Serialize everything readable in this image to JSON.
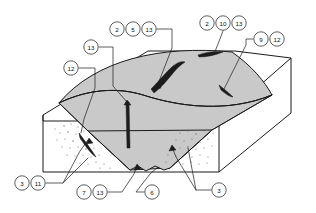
{
  "figure": {
    "type": "block-diagram",
    "background_color": "#ffffff",
    "line_color": "#1a1a1a",
    "basin_fill_color": "#c9c9c9",
    "block_top_fill_color": "#ffffff",
    "sliver_fill_color": "#1c1c1c",
    "stipple_color": "#6d6d6d"
  },
  "callouts": [
    {
      "id": "c-13-upper-left",
      "label": "13",
      "cx": 91,
      "cy": 47
    },
    {
      "id": "c-12-left",
      "label": "12",
      "cx": 71,
      "cy": 68
    },
    {
      "id": "c-2-top",
      "label": "2",
      "cx": 117,
      "cy": 29
    },
    {
      "id": "c-5-top",
      "label": "5",
      "cx": 133,
      "cy": 29
    },
    {
      "id": "c-13-top",
      "label": "13",
      "cx": 149,
      "cy": 29
    },
    {
      "id": "c-2-topright",
      "label": "2",
      "cx": 207,
      "cy": 23
    },
    {
      "id": "c-10-topright",
      "label": "10",
      "cx": 223,
      "cy": 23
    },
    {
      "id": "c-13-topright",
      "label": "13",
      "cx": 239,
      "cy": 23
    },
    {
      "id": "c-9-right",
      "label": "9",
      "cx": 261,
      "cy": 39
    },
    {
      "id": "c-12-right",
      "label": "12",
      "cx": 277,
      "cy": 39
    },
    {
      "id": "c-3-bottomleft",
      "label": "3",
      "cx": 22,
      "cy": 183
    },
    {
      "id": "c-11-bottomleft",
      "label": "11",
      "cx": 38,
      "cy": 183
    },
    {
      "id": "c-7-bottom",
      "label": "7",
      "cx": 84,
      "cy": 192
    },
    {
      "id": "c-13-bottom",
      "label": "13",
      "cx": 100,
      "cy": 192
    },
    {
      "id": "c-6-bottom",
      "label": "6",
      "cx": 152,
      "cy": 192
    },
    {
      "id": "c-3-bottomright",
      "label": "3",
      "cx": 219,
      "cy": 190
    }
  ]
}
